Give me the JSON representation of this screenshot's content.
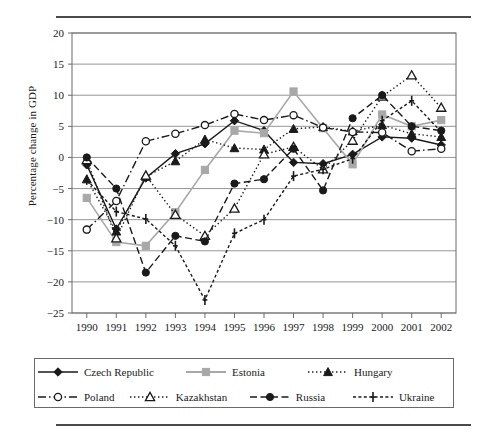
{
  "chart_data": {
    "type": "line",
    "title": "",
    "xlabel": "Year",
    "ylabel": "Percentage change in GDP",
    "categories": [
      1990,
      1991,
      1992,
      1993,
      1994,
      1995,
      1996,
      1997,
      1998,
      1999,
      2000,
      2001,
      2002
    ],
    "xtick_labels": [
      "1990",
      "1991",
      "1992",
      "1993",
      "1994",
      "1995",
      "1996",
      "1997",
      "1998",
      "1999",
      "2000",
      "2001",
      "2002"
    ],
    "ytick_labels": [
      "20",
      "15",
      "10",
      "5",
      "0",
      "-5",
      "-10",
      "-15",
      "-20",
      "-25"
    ],
    "ylim": [
      -25,
      20
    ],
    "ytick_values": [
      20,
      15,
      10,
      5,
      0,
      -5,
      -10,
      -15,
      -20,
      -25
    ],
    "grid": "horizontal",
    "legend_position": "below",
    "series": [
      {
        "name": "Czech Republic",
        "marker": "filled-diamond",
        "color": "#1a1a1a",
        "dash": "solid",
        "values": [
          -1.2,
          -11.5,
          -3.3,
          0.6,
          2.2,
          5.9,
          4.3,
          -0.8,
          -1.0,
          0.5,
          3.3,
          3.1,
          2.0
        ]
      },
      {
        "name": "Estonia",
        "marker": "filled-square",
        "color": "#a8a8a8",
        "dash": "solid",
        "values": [
          -6.5,
          -13.6,
          -14.2,
          -8.8,
          -2.0,
          4.3,
          3.9,
          10.6,
          4.7,
          -1.1,
          6.9,
          5.0,
          6.0
        ]
      },
      {
        "name": "Hungary",
        "marker": "filled-triangle",
        "color": "#1a1a1a",
        "dash": "dotted",
        "values": [
          -3.5,
          -11.9,
          -3.1,
          -0.6,
          2.9,
          1.5,
          1.3,
          4.6,
          4.9,
          4.2,
          5.2,
          3.8,
          3.3
        ]
      },
      {
        "name": "Poland",
        "marker": "open-circle",
        "color": "#1a1a1a",
        "dash": "dash-dot",
        "values": [
          -11.6,
          -7.0,
          2.6,
          3.8,
          5.2,
          7.0,
          6.0,
          6.8,
          4.8,
          4.1,
          4.0,
          1.0,
          1.4
        ]
      },
      {
        "name": "Kazakhstan",
        "marker": "open-triangle",
        "color": "#1a1a1a",
        "dash": "dotted",
        "values": [
          -0.4,
          -13.0,
          -2.9,
          -9.2,
          -12.6,
          -8.2,
          0.5,
          1.7,
          -1.9,
          2.7,
          9.8,
          13.2,
          8.0
        ]
      },
      {
        "name": "Russia",
        "marker": "filled-circle",
        "color": "#1a1a1a",
        "dash": "dashed",
        "values": [
          0.0,
          -5.0,
          -18.5,
          -12.6,
          -13.5,
          -4.2,
          -3.5,
          1.4,
          -5.3,
          6.3,
          10.0,
          5.0,
          4.3
        ]
      },
      {
        "name": "Ukraine",
        "marker": "plus",
        "color": "#1a1a1a",
        "dash": "fine-dashed",
        "values": [
          -3.6,
          -8.7,
          -9.9,
          -14.2,
          -22.9,
          -12.2,
          -10.0,
          -3.0,
          -1.9,
          -0.2,
          5.9,
          9.1,
          4.1
        ]
      }
    ]
  },
  "legend": {
    "entries": [
      {
        "label": "Czech Republic"
      },
      {
        "label": "Estonia"
      },
      {
        "label": "Hungary"
      },
      {
        "label": "Poland"
      },
      {
        "label": "Kazakhstan"
      },
      {
        "label": "Russia"
      },
      {
        "label": "Ukraine"
      }
    ]
  },
  "colors": {
    "axis": "#6a6a6a",
    "grid": "#8a8a8a",
    "ink": "#1a1a1a",
    "estonia_gray": "#a8a8a8"
  }
}
